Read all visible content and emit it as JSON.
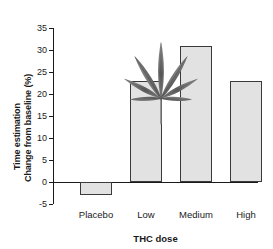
{
  "chart_data": {
    "type": "bar",
    "title": "",
    "subtitle": "",
    "categories": [
      "Placebo",
      "Low",
      "Medium",
      "High"
    ],
    "values": [
      -3,
      23,
      31,
      23
    ],
    "xlabel": "THC dose",
    "ylabel": "Time estimation Change from baseline (%)",
    "ylabel_lines": [
      "Time estimation",
      "Change from baseline (%)"
    ],
    "ylim": [
      -5,
      35
    ],
    "yticks": [
      35,
      30,
      25,
      20,
      15,
      10,
      5,
      0,
      -5
    ],
    "ytick_labels": [
      "35",
      "30",
      "25",
      "20",
      "15",
      "10",
      "5",
      "0",
      "-5"
    ],
    "grid": false,
    "legend": null,
    "legend_position": "none",
    "series": [
      {
        "name": "Time estimation change from baseline",
        "values": [
          -3,
          23,
          31,
          23
        ]
      }
    ],
    "annotations": [
      {
        "name": "cannabis-leaf-image",
        "type": "image",
        "description": "grayscale cannabis leaf photograph placed in upper-left of plot area"
      }
    ],
    "colors": {
      "bar_fill": "#e2e2e2",
      "bar_edge": "#3a3a3a",
      "axis": "#1a1a1a",
      "background": "#ffffff",
      "leaf": "#6e6e6e"
    }
  },
  "axes": {
    "y": {
      "label_line1": "Time estimation",
      "label_line2": "Change from baseline (%)",
      "ticks": [
        {
          "value": 35,
          "label": "35"
        },
        {
          "value": 30,
          "label": "30"
        },
        {
          "value": 25,
          "label": "25"
        },
        {
          "value": 20,
          "label": "20"
        },
        {
          "value": 15,
          "label": "15"
        },
        {
          "value": 10,
          "label": "10"
        },
        {
          "value": 5,
          "label": "5"
        },
        {
          "value": 0,
          "label": "0"
        },
        {
          "value": -5,
          "label": "-5"
        }
      ]
    },
    "x": {
      "label": "THC dose",
      "categories": [
        {
          "label": "Placebo",
          "value": -3
        },
        {
          "label": "Low",
          "value": 23
        },
        {
          "label": "Medium",
          "value": 31
        },
        {
          "label": "High",
          "value": 23
        }
      ]
    }
  }
}
